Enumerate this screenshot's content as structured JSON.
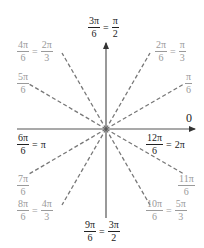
{
  "diagram": {
    "type": "unit-circle-angles",
    "center": [
      106,
      129
    ],
    "axes": {
      "horizontal": {
        "from": 17,
        "to": 196,
        "arrow": "right",
        "end_label": "0"
      },
      "vertical": {
        "from": 218,
        "to": 42,
        "arrow": "up"
      }
    },
    "colors": {
      "axis": "#555555",
      "dashed": "#777777",
      "axis_label": "#222222",
      "angle_label": "#9a9a9a"
    },
    "labels": {
      "zero": "0",
      "a90": {
        "n1": "3π",
        "d1": "6",
        "n2": "π",
        "d2": "2"
      },
      "a60": {
        "n1": "2π",
        "d1": "6",
        "n2": "π",
        "d2": "3"
      },
      "a30": {
        "n1": "π",
        "d1": "6"
      },
      "a120": {
        "n1": "4π",
        "d1": "6",
        "n2": "2π",
        "d2": "3"
      },
      "a150": {
        "n1": "5π",
        "d1": "6"
      },
      "a180": {
        "n1": "6π",
        "d1": "6",
        "rhs": "π"
      },
      "a360": {
        "n1": "12π",
        "d1": "6",
        "rhs": "2π"
      },
      "a210": {
        "n1": "7π",
        "d1": "6"
      },
      "a240": {
        "n1": "8π",
        "d1": "6",
        "n2": "4π",
        "d2": "3"
      },
      "a270": {
        "n1": "9π",
        "d1": "6",
        "n2": "3π",
        "d2": "2"
      },
      "a300": {
        "n1": "10π",
        "d1": "6",
        "n2": "5π",
        "d2": "3"
      },
      "a330": {
        "n1": "11π",
        "d1": "6"
      },
      "equals": "="
    },
    "dashed_angles_deg": [
      30,
      60,
      120,
      150,
      210,
      240,
      300,
      330
    ]
  }
}
